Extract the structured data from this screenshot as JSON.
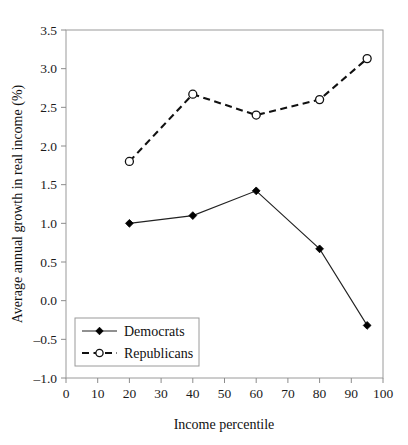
{
  "chart_data": {
    "type": "line",
    "title": "",
    "xlabel": "Income percentile",
    "ylabel": "Average annual growth in real income (%)",
    "xlim": [
      0,
      100
    ],
    "ylim": [
      -1.0,
      3.5
    ],
    "xticks": [
      0,
      10,
      20,
      30,
      40,
      50,
      60,
      70,
      80,
      90,
      100
    ],
    "xtick_labels": [
      "0",
      "10",
      "20",
      "30",
      "40",
      "50",
      "60",
      "70",
      "80",
      "90",
      "100"
    ],
    "yticks": [
      -1.0,
      -0.5,
      0.0,
      0.5,
      1.0,
      1.5,
      2.0,
      2.5,
      3.0,
      3.5
    ],
    "ytick_labels": [
      "-1.0",
      "-0.5",
      "0.0",
      "0.5",
      "1.0",
      "1.5",
      "2.0",
      "2.5",
      "3.0",
      "3.5"
    ],
    "grid": false,
    "legend_position": "lower left",
    "series": [
      {
        "name": "Democrats",
        "line_style": "solid",
        "marker": "filled-diamond",
        "color": "#000000",
        "x": [
          20,
          40,
          60,
          80,
          95
        ],
        "values": [
          1.0,
          1.1,
          1.42,
          0.67,
          -0.32
        ]
      },
      {
        "name": "Republicans",
        "line_style": "dashed",
        "marker": "open-circle",
        "color": "#111111",
        "x": [
          20,
          40,
          60,
          80,
          95
        ],
        "values": [
          1.8,
          2.67,
          2.4,
          2.6,
          3.13
        ]
      }
    ]
  },
  "legend": {
    "items": [
      {
        "label": "Democrats"
      },
      {
        "label": "Republicans"
      }
    ]
  }
}
